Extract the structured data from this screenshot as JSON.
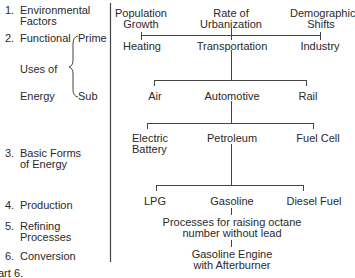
{
  "levels": [
    {
      "num": "1.",
      "label_lines": [
        "Environmental",
        "Factors"
      ]
    },
    {
      "num": "2.",
      "label_lines": [
        "Functional",
        "Uses of",
        "Energy"
      ],
      "brace": {
        "top": "Prime",
        "bottom": "Sub"
      }
    },
    {
      "num": "3.",
      "label_lines": [
        "Basic Forms",
        "of Energy"
      ]
    },
    {
      "num": "4.",
      "label_lines": [
        "Production"
      ]
    },
    {
      "num": "5.",
      "label_lines": [
        "Refining",
        "Processes"
      ]
    },
    {
      "num": "6.",
      "label_lines": [
        "Conversion"
      ]
    }
  ],
  "tree": {
    "environmental": [
      {
        "lines": [
          "Population",
          "Growth"
        ]
      },
      {
        "lines": [
          "Rate of",
          "Urbanization"
        ]
      },
      {
        "lines": [
          "Demographic",
          "Shifts"
        ]
      }
    ],
    "prime_uses": [
      "Heating",
      "Transportation",
      "Industry"
    ],
    "sub_uses": [
      "Air",
      "Automotive",
      "Rail"
    ],
    "basic_forms": [
      {
        "lines": [
          "Electric",
          "Battery"
        ]
      },
      {
        "lines": [
          "Petroleum"
        ]
      },
      {
        "lines": [
          "Fuel Cell"
        ]
      }
    ],
    "production": [
      "LPG",
      "Gasoline",
      "Diesel Fuel"
    ],
    "refining": [
      "Processes for raising octane",
      "number without lead"
    ],
    "conversion": [
      "Gasoline Engine",
      "with Afterburner"
    ]
  },
  "caption": "art 6."
}
